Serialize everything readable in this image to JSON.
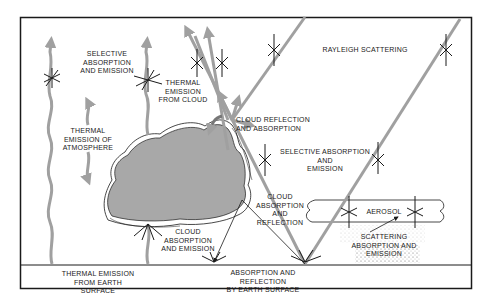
{
  "colors": {
    "frame": "#1a1a1a",
    "radiation_arrow": "#a0a0a0",
    "cloud_fill": "#a8a8a8",
    "background": "#ffffff"
  },
  "labels": {
    "selective_absorption_top": "SELECTIVE\nABSORPTION\nAND EMISSION",
    "thermal_emission_cloud": "THERMAL\nEMISSION\nFROM CLOUD",
    "rayleigh": "RAYLEIGH SCATTERING",
    "thermal_emission_atmosphere": "THERMAL\nEMISSION OF\nATMOSPHERE",
    "cloud_reflection_absorption": "CLOUD REFLECTION\nAND ABSORPTION",
    "selective_absorption_mid": "SELECTIVE ABSORPTION\nAND\nEMISSION",
    "cloud_absorption_reflection": "CLOUD\nABSORPTION\nAND\nREFLECTION",
    "aerosol": "AEROSOL",
    "cloud_absorption_emission": "CLOUD\nABSORPTION\nAND EMISSION",
    "scattering_aerosol": "SCATTERING\nABSORPTION AND EMISSION",
    "thermal_emission_earth": "THERMAL EMISSION\nFROM EARTH SURFACE",
    "absorption_reflection_earth": "ABSORPTION AND REFLECTION\nBY EARTH SURFACE"
  }
}
